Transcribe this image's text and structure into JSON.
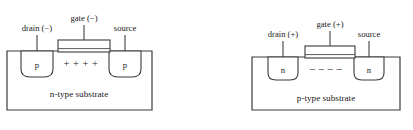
{
  "figure": {
    "name": "mosfet-cross-sections",
    "background_color": "#ffffff",
    "line_color": "#3a3a3a",
    "text_color": "#1a1a1a"
  },
  "diagrams": [
    {
      "id": "p-channel-mosfet",
      "substrate_label": "n-type substrate",
      "substrate_type": "n-type",
      "drain_label": "drain (−)",
      "gate_label": "gate (−)",
      "source_label": "source",
      "drain_well_label": "p",
      "source_well_label": "p",
      "channel_carriers": "+ + + +",
      "channel_carrier_sign": "+",
      "channel_carrier_count": 4
    },
    {
      "id": "n-channel-mosfet",
      "substrate_label": "p-type substrate",
      "substrate_type": "p-type",
      "drain_label": "drain (+)",
      "gate_label": "gate (+)",
      "source_label": "source",
      "drain_well_label": "n",
      "source_well_label": "n",
      "channel_carriers": "–  –  –  –",
      "channel_carrier_sign": "–",
      "channel_carrier_count": 4
    }
  ]
}
